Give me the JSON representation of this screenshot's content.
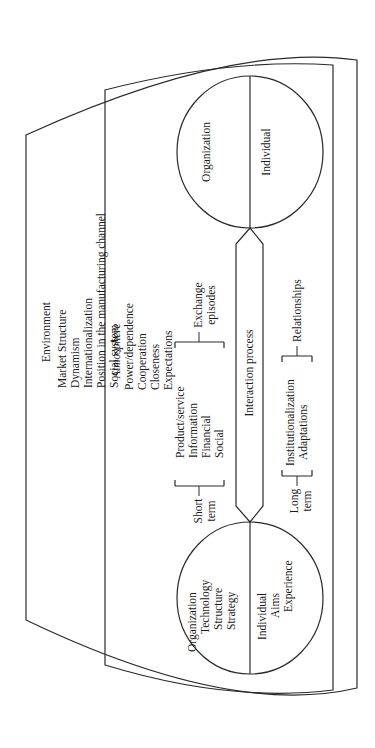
{
  "environment": {
    "title": "Environment",
    "items": [
      "Market Structure",
      "Dynamism",
      "Internationalization",
      "Position in the manufacturing channel",
      "Social system"
    ]
  },
  "atmosphere": {
    "title": "Atmosphere",
    "items": [
      "Power/dependence",
      "Cooperation",
      "Closeness",
      "Expectations"
    ]
  },
  "left_party": {
    "organization": {
      "label": "Organization",
      "attributes": [
        "Technology",
        "Structure",
        "Strategy"
      ]
    },
    "individual": {
      "label": "Individual",
      "attributes": [
        "Aims",
        "Experience"
      ]
    }
  },
  "right_party": {
    "organization": {
      "label": "Organization"
    },
    "individual": {
      "label": "Individual"
    }
  },
  "short_term": {
    "label_line1": "Short",
    "label_line2": "term",
    "items": [
      "Product/service",
      "Information",
      "Financial",
      "Social"
    ],
    "result_line1": "Exchange",
    "result_line2": "episodes"
  },
  "interaction": {
    "label": "Interaction process"
  },
  "long_term": {
    "label_line1": "Long",
    "label_line2": "term",
    "items": [
      "Institutionalization",
      "Adaptations"
    ],
    "result": "Relationships"
  }
}
